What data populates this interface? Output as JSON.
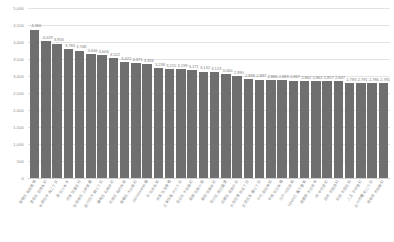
{
  "chart_data": {
    "type": "bar",
    "title": "",
    "subtitle": "",
    "xlabel": "",
    "ylabel": "",
    "ylim": [
      0,
      5000
    ],
    "grid": true,
    "legend": false,
    "orientation": "vertical",
    "bar_color": "#6f6f6f",
    "label_color": "#7d7d7d",
    "gridline_color": "#e3e3e3",
    "y_ticks": [
      "0",
      "500",
      "1,000",
      "1,500",
      "2,000",
      "2,500",
      "3,000",
      "3,500",
      "4,000",
      "4,500",
      "5,000"
    ],
    "y_tick_values": [
      0,
      500,
      1000,
      1500,
      2000,
      2500,
      3000,
      3500,
      4000,
      4500,
      5000
    ],
    "categories": [
      "新宿区高田馬場",
      "豊島区池袋本町",
      "中野区中央二丁目",
      "港区六本木",
      "渋谷区道玄坂",
      "世田谷区三軒茶屋",
      "品川区大崎三丁目",
      "練馬区石神井町",
      "杉並区高円寺南",
      "板橋区大山東町",
      "NERIMA中村橋",
      "北区赤羽南",
      "台東区浅草橋",
      "江東区亀戸六丁目",
      "足立区千住旭町",
      "葛飾区新小岩",
      "墨田区錦糸町",
      "荒川区西日暮里",
      "目黒区自由が丘",
      "大田区蒲田五丁目",
      "文京区本郷三丁目",
      "千代田区神田",
      "中央区日本橋",
      "江戸川区船堀",
      "NEWS三鷹下連雀",
      "武蔵野市吉祥寺",
      "府中市宮町",
      "調布市国領町",
      "町田市原町田",
      "八王子市旭町",
      "立川市曙町二丁目",
      "西東京市田無町"
    ],
    "values": [
      4366,
      4029,
      3956,
      3784,
      3748,
      3646,
      3606,
      3522,
      3421,
      3371,
      3356,
      3238,
      3215,
      3199,
      3171,
      3132,
      3123,
      3060,
      2990,
      2899,
      2897,
      2886,
      2883,
      2867,
      2862,
      2862,
      2857,
      2847,
      2793,
      2791,
      2786,
      2781
    ],
    "value_labels": [
      "4,366",
      "4,029",
      "3,956",
      "3,784",
      "3,748",
      "3,646",
      "3,606",
      "3,522",
      "3,421",
      "3,371",
      "3,356",
      "3,238",
      "3,215",
      "3,199",
      "3,171",
      "3,132",
      "3,123",
      "3,060",
      "2,990",
      "2,899",
      "2,897",
      "2,886",
      "2,883",
      "2,867",
      "2,862",
      "2,862",
      "2,857",
      "2,847",
      "2,793",
      "2,791",
      "2,786",
      "2,781"
    ]
  }
}
